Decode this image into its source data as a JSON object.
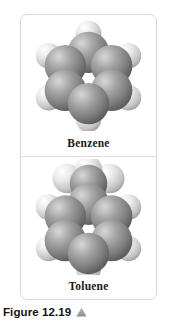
{
  "figure": {
    "caption_text": "Figure 12.19",
    "caption_marker_icon": "up-triangle-icon",
    "marker_color": "#9a9a9a",
    "frame_border_color": "#d9d9d9",
    "divider_color": "#dcdcdc",
    "background_color": "#ffffff"
  },
  "panels": [
    {
      "id": "benzene",
      "label": "Benzene",
      "model_type": "space-filling",
      "formula": "C6H6",
      "carbon_count": 6,
      "hydrogen_count": 6,
      "carbon_color": "#8e8e8e",
      "hydrogen_color": "#e2e2e2"
    },
    {
      "id": "toluene",
      "label": "Toluene",
      "model_type": "space-filling",
      "formula": "C7H8",
      "carbon_count": 7,
      "hydrogen_count": 8,
      "carbon_color": "#8e8e8e",
      "hydrogen_color": "#e2e2e2"
    }
  ]
}
